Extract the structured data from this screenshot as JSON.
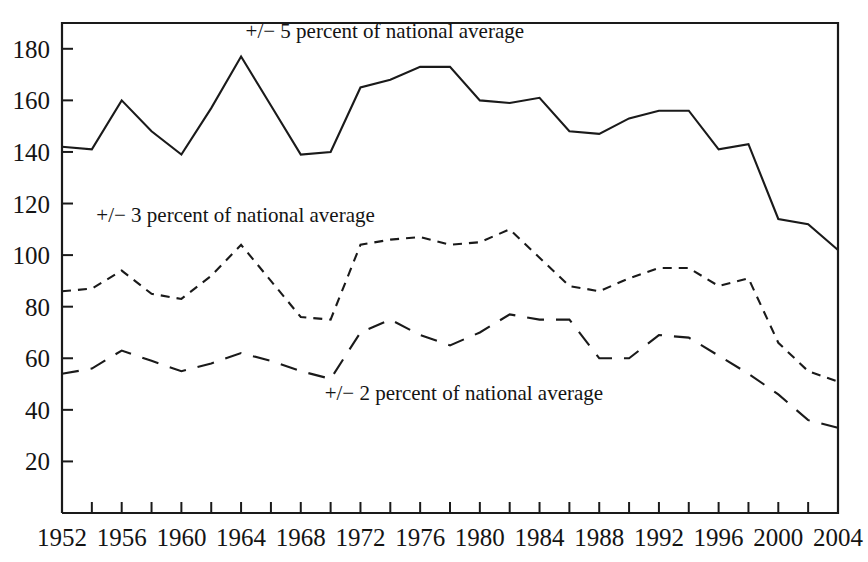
{
  "chart_data": {
    "type": "line",
    "title": "",
    "subtitle": "",
    "xlabel": "",
    "ylabel": "",
    "xlim": [
      1952,
      2004
    ],
    "ylim": [
      0,
      190
    ],
    "grid": false,
    "legend_position": "inline-annotations",
    "x": [
      1952,
      1954,
      1956,
      1958,
      1960,
      1962,
      1964,
      1966,
      1968,
      1970,
      1972,
      1974,
      1976,
      1978,
      1980,
      1982,
      1984,
      1986,
      1988,
      1990,
      1992,
      1994,
      1996,
      1998,
      2000,
      2002,
      2004
    ],
    "xticks": [
      1952,
      1954,
      1956,
      1958,
      1960,
      1962,
      1964,
      1966,
      1968,
      1970,
      1972,
      1974,
      1976,
      1978,
      1980,
      1982,
      1984,
      1986,
      1988,
      1990,
      1992,
      1994,
      1996,
      1998,
      2000,
      2002,
      2004
    ],
    "xtick_labels": [
      "1952",
      "",
      "1956",
      "",
      "1960",
      "",
      "1964",
      "",
      "1968",
      "",
      "1972",
      "",
      "1976",
      "",
      "1980",
      "",
      "1984",
      "",
      "1988",
      "",
      "1992",
      "",
      "1996",
      "",
      "2000",
      "",
      "2004"
    ],
    "yticks": [
      20,
      40,
      60,
      80,
      100,
      120,
      140,
      160,
      180
    ],
    "ytick_labels": [
      "20",
      "40",
      "60",
      "80",
      "100",
      "120",
      "140",
      "160",
      "180"
    ],
    "series": [
      {
        "name": "+/- 5 percent of national average",
        "style": "solid",
        "stroke_width": 2.1,
        "dasharray": "",
        "label_text": "+/− 5 percent of national average",
        "label_x": 1964.3,
        "label_y": 184,
        "values": [
          142,
          141,
          160,
          148,
          139,
          157,
          177,
          158,
          139,
          140,
          165,
          168,
          173,
          173,
          160,
          159,
          161,
          148,
          147,
          153,
          156,
          156,
          141,
          143,
          114,
          112,
          102
        ]
      },
      {
        "name": "+/- 3 percent of national average",
        "style": "short-dashed",
        "stroke_width": 2.1,
        "dasharray": "9 7",
        "label_text": "+/− 3 percent of national average",
        "label_x": 1954.3,
        "label_y": 113,
        "values": [
          86,
          87,
          94,
          85,
          83,
          92,
          104,
          90,
          76,
          75,
          104,
          106,
          107,
          104,
          105,
          110,
          99,
          88,
          86,
          91,
          95,
          95,
          88,
          91,
          66,
          55,
          51
        ]
      },
      {
        "name": "+/- 2 percent of national average",
        "style": "long-dashed",
        "stroke_width": 2.1,
        "dasharray": "17 12",
        "label_text": "+/− 2 percent of national average",
        "label_x": 1969.6,
        "label_y": 44,
        "values": [
          54,
          56,
          63,
          59,
          55,
          58,
          62,
          59,
          55,
          52,
          70,
          75,
          69,
          65,
          70,
          77,
          75,
          75,
          60,
          60,
          69,
          68,
          61,
          54,
          46,
          36,
          33
        ]
      }
    ]
  },
  "axes": {
    "frame_color": "#1a1a1a"
  }
}
